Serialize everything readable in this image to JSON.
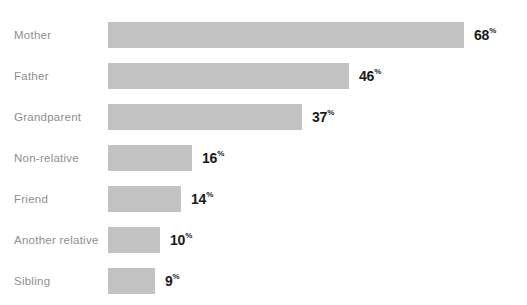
{
  "chart_data": {
    "type": "bar",
    "orientation": "horizontal",
    "title": "WHOSE FAITH INFLUENCED YOU?",
    "xlabel": "",
    "ylabel": "",
    "xlim": [
      0,
      72
    ],
    "grid": false,
    "legend": null,
    "value_suffix": "%",
    "categories": [
      "Mother",
      "Father",
      "Grandparent",
      "Non-relative",
      "Friend",
      "Another relative",
      "Sibling"
    ],
    "values": [
      68,
      46,
      37,
      16,
      14,
      10,
      9
    ],
    "bars": [
      {
        "label": "Mother",
        "value": 68,
        "value_text": "68",
        "pct_symbol": "%"
      },
      {
        "label": "Father",
        "value": 46,
        "value_text": "46",
        "pct_symbol": "%"
      },
      {
        "label": "Grandparent",
        "value": 37,
        "value_text": "37",
        "pct_symbol": "%"
      },
      {
        "label": "Non-relative",
        "value": 16,
        "value_text": "16",
        "pct_symbol": "%"
      },
      {
        "label": "Friend",
        "value": 14,
        "value_text": "14",
        "pct_symbol": "%"
      },
      {
        "label": "Another relative",
        "value": 10,
        "value_text": "10",
        "pct_symbol": "%"
      },
      {
        "label": "Sibling",
        "value": 9,
        "value_text": "9",
        "pct_symbol": "%"
      }
    ],
    "colors": {
      "background": "#ffffff",
      "bar_fill": "#c2c2c2",
      "category_label": "#8e8e8e",
      "value_label": "#1a1a1a",
      "title": "#4a4a4a"
    }
  }
}
